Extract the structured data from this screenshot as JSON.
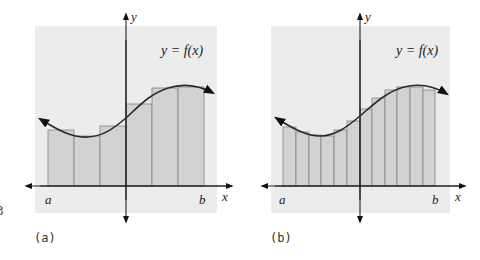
{
  "figure": {
    "panels": [
      {
        "id": "a",
        "caption": "(a)",
        "function_label": "y = f(x)",
        "x_axis_label": "x",
        "y_axis_label": "y",
        "left_endpoint_label": "a",
        "right_endpoint_label": "b",
        "rectangle_count": 6
      },
      {
        "id": "b",
        "caption": "(b)",
        "function_label": "y = f(x)",
        "x_axis_label": "x",
        "y_axis_label": "y",
        "left_endpoint_label": "a",
        "right_endpoint_label": "b",
        "rectangle_count": 12
      }
    ],
    "edge_fragment": "3",
    "colors": {
      "panel_background": "#ececec",
      "bar_fill": "#d2d2d2",
      "bar_stroke": "#8a8a8a",
      "axis": "#222222",
      "curve": "#2a2a2a"
    }
  }
}
